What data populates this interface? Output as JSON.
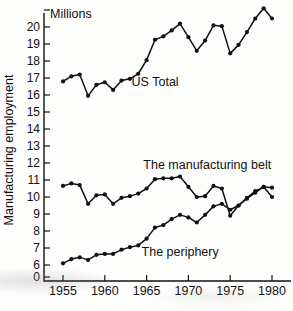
{
  "figure": {
    "unit_caption": "Millions",
    "y_axis_title": "Manufacturing employment",
    "x_axis_title": ""
  },
  "chart_data": {
    "type": "line",
    "title": "",
    "subtitle": "",
    "xlabel": "",
    "ylabel": "Manufacturing employment",
    "unit_note": "Millions",
    "grid": false,
    "legend_position": "inline-annotations",
    "xlim": [
      1954,
      1980.6
    ],
    "ylim": [
      5.6,
      21.4
    ],
    "y_axis_break_at_zero": true,
    "yticks": [
      0,
      6,
      7,
      8,
      9,
      10,
      11,
      12,
      13,
      14,
      15,
      16,
      17,
      18,
      19,
      20,
      21
    ],
    "ytick_labels": [
      "0",
      "6",
      "7",
      "8",
      "9",
      "10",
      "11",
      "12",
      "13",
      "14",
      "15",
      "16",
      "17",
      "18",
      "19",
      "20",
      ""
    ],
    "xticks": [
      1955,
      1960,
      1965,
      1970,
      1975,
      1980
    ],
    "xtick_labels": [
      "1955",
      "1960",
      "1965",
      "1970",
      "1975",
      "1980"
    ],
    "x": [
      1955,
      1956,
      1957,
      1958,
      1959,
      1960,
      1961,
      1962,
      1963,
      1964,
      1965,
      1966,
      1967,
      1968,
      1969,
      1970,
      1971,
      1972,
      1973,
      1974,
      1975,
      1976,
      1977,
      1978,
      1979,
      1980
    ],
    "series": [
      {
        "name": "US Total",
        "label": "US Total",
        "label_x": 1963.2,
        "label_y": 16.75,
        "values": [
          16.8,
          17.1,
          17.2,
          15.95,
          16.6,
          16.75,
          16.3,
          16.85,
          16.95,
          17.25,
          18.05,
          19.25,
          19.45,
          19.8,
          20.2,
          19.4,
          18.6,
          19.2,
          20.1,
          20.05,
          18.45,
          18.95,
          19.7,
          20.5,
          21.1,
          20.5
        ]
      },
      {
        "name": "The manufacturing belt",
        "label": "The manufacturing belt",
        "label_x": 1964.6,
        "label_y": 11.9,
        "values": [
          10.65,
          10.8,
          10.7,
          9.6,
          10.1,
          10.15,
          9.6,
          9.95,
          10.05,
          10.2,
          10.5,
          11.05,
          11.1,
          11.1,
          11.2,
          10.6,
          10.0,
          10.05,
          10.65,
          10.5,
          8.9,
          9.5,
          9.95,
          10.35,
          10.6,
          10.0
        ]
      },
      {
        "name": "The periphery",
        "label": "The periphery",
        "label_x": 1964.4,
        "label_y": 6.75,
        "values": [
          6.1,
          6.35,
          6.45,
          6.3,
          6.6,
          6.65,
          6.65,
          6.9,
          7.05,
          7.15,
          7.55,
          8.2,
          8.35,
          8.7,
          8.95,
          8.8,
          8.5,
          8.95,
          9.45,
          9.6,
          9.25,
          9.5,
          9.9,
          10.25,
          10.6,
          10.55
        ]
      }
    ]
  }
}
